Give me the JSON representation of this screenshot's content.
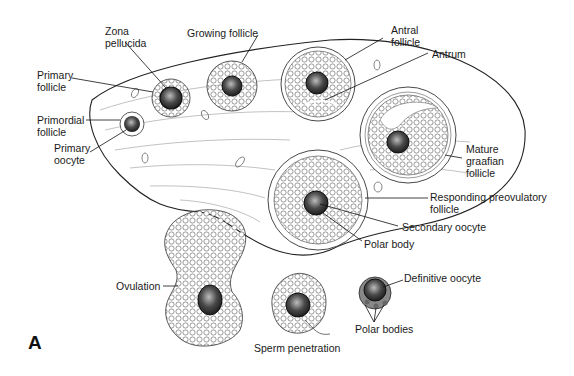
{
  "figure": {
    "panel_label": "A",
    "type": "anatomical illustration",
    "colors": {
      "ink": "#1a1a1a",
      "oocyte": "#3a3a3a",
      "background": "#ffffff"
    }
  },
  "labels": {
    "zona_pellucida": "Zona\npellucida",
    "growing_follicle": "Growing follicle",
    "antral_follicle": "Antral\nfollicle",
    "antrum": "Antrum",
    "primary_follicle": "Primary\nfollicle",
    "primordial_follicle": "Primordial\nfollicle",
    "primary_oocyte": "Primary\noocyte",
    "mature_graafian_follicle": "Mature\ngraafian\nfollicle",
    "responding_preovulatory_follicle": "Responding preovulatory\nfollicle",
    "secondary_oocyte": "Secondary oocyte",
    "polar_body": "Polar body",
    "ovulation": "Ovulation",
    "definitive_oocyte": "Definitive oocyte",
    "polar_bodies": "Polar bodies",
    "sperm_penetration": "Sperm penetration"
  }
}
